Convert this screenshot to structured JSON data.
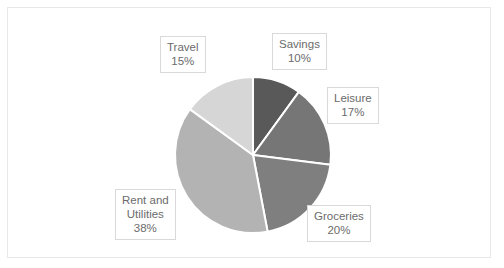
{
  "chart_data": {
    "type": "pie",
    "title": "",
    "categories": [
      "Savings",
      "Leisure",
      "Groceries",
      "Rent and Utilities",
      "Travel"
    ],
    "values": [
      10,
      17,
      20,
      38,
      15
    ],
    "value_unit": "%",
    "legend": "none",
    "grid": false,
    "start_angle_deg": 0,
    "direction": "clockwise",
    "slice_colors": [
      "#595959",
      "#767676",
      "#7f7f7f",
      "#b3b3b3",
      "#d6d6d6"
    ],
    "slice_border_color": "#ffffff",
    "labels": [
      {
        "name": "Savings",
        "value": "10%"
      },
      {
        "name": "Leisure",
        "value": "17%"
      },
      {
        "name": "Groceries",
        "value": "20%"
      },
      {
        "name": "Rent and Utilities",
        "value": "38%"
      },
      {
        "name": "Travel",
        "value": "15%"
      }
    ],
    "label_text": {
      "savings_name": "Savings",
      "savings_value": "10%",
      "leisure_name": "Leisure",
      "leisure_value": "17%",
      "groceries_name": "Groceries",
      "groceries_value": "20%",
      "rent_name_line1": "Rent and",
      "rent_name_line2": "Utilities",
      "rent_value": "38%",
      "travel_name": "Travel",
      "travel_value": "15%"
    }
  },
  "frame": {
    "border_color": "#e8e8e8",
    "background": "#ffffff"
  },
  "geometry": {
    "center_x": 253,
    "center_y": 155,
    "radius": 78
  }
}
